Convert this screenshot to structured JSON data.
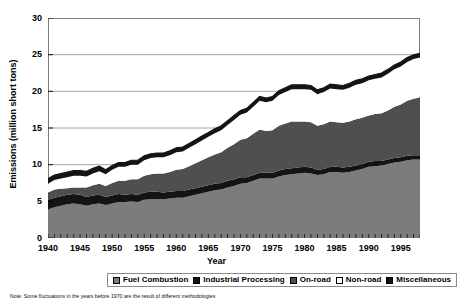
{
  "chart_data": {
    "type": "area",
    "stacked": true,
    "title": "",
    "xlabel": "Year",
    "ylabel": "Emissions (million short tons)",
    "xlim": [
      1940,
      1998
    ],
    "ylim": [
      0,
      30
    ],
    "ytick_step": 5,
    "yticks": [
      "0",
      "5",
      "10",
      "15",
      "20",
      "25",
      "30"
    ],
    "xticks": [
      "1940",
      "1945",
      "1950",
      "1955",
      "1960",
      "1965",
      "1970",
      "1975",
      "1980",
      "1985",
      "1990",
      "1995"
    ],
    "xtick_values": [
      1940,
      1945,
      1950,
      1955,
      1960,
      1965,
      1970,
      1975,
      1980,
      1985,
      1990,
      1995
    ],
    "minor_xticks": "annual",
    "grid": "horizontal",
    "legend_position": "bottom",
    "x": [
      1940,
      1941,
      1942,
      1943,
      1944,
      1945,
      1946,
      1947,
      1948,
      1949,
      1950,
      1951,
      1952,
      1953,
      1954,
      1955,
      1956,
      1957,
      1958,
      1959,
      1960,
      1961,
      1962,
      1963,
      1964,
      1965,
      1966,
      1967,
      1968,
      1969,
      1970,
      1971,
      1972,
      1973,
      1974,
      1975,
      1976,
      1977,
      1978,
      1979,
      1980,
      1981,
      1982,
      1983,
      1984,
      1985,
      1986,
      1987,
      1988,
      1989,
      1990,
      1991,
      1992,
      1993,
      1994,
      1995,
      1996,
      1997,
      1998
    ],
    "series": [
      {
        "name": "Fuel Combustion",
        "color": "#7c7c7c",
        "values": [
          3.9,
          4.2,
          4.4,
          4.6,
          4.7,
          4.6,
          4.4,
          4.6,
          4.7,
          4.5,
          4.7,
          4.9,
          4.9,
          5.0,
          4.9,
          5.2,
          5.3,
          5.3,
          5.3,
          5.4,
          5.5,
          5.5,
          5.7,
          5.9,
          6.1,
          6.3,
          6.5,
          6.6,
          6.9,
          7.1,
          7.4,
          7.5,
          7.8,
          8.1,
          8.1,
          8.1,
          8.4,
          8.6,
          8.7,
          8.8,
          8.9,
          8.8,
          8.6,
          8.7,
          9.0,
          9.0,
          8.9,
          9.0,
          9.2,
          9.4,
          9.7,
          9.8,
          9.9,
          10.1,
          10.3,
          10.4,
          10.6,
          10.7,
          10.7
        ]
      },
      {
        "name": "Industrial Processing",
        "color": "#141414",
        "values": [
          1.3,
          1.3,
          1.3,
          1.3,
          1.3,
          1.3,
          1.2,
          1.2,
          1.2,
          1.1,
          1.1,
          1.1,
          1.0,
          1.0,
          1.0,
          1.0,
          1.0,
          1.0,
          0.9,
          0.9,
          0.9,
          0.9,
          0.9,
          0.9,
          0.9,
          0.9,
          0.9,
          0.9,
          0.9,
          0.9,
          0.9,
          0.8,
          0.8,
          0.8,
          0.8,
          0.8,
          0.8,
          0.8,
          0.8,
          0.8,
          0.8,
          0.8,
          0.7,
          0.7,
          0.7,
          0.7,
          0.7,
          0.7,
          0.7,
          0.7,
          0.7,
          0.7,
          0.6,
          0.6,
          0.6,
          0.6,
          0.6,
          0.6,
          0.6
        ]
      },
      {
        "name": "On-road",
        "color": "#4f4f4f",
        "values": [
          1.0,
          1.1,
          1.0,
          0.9,
          0.9,
          1.0,
          1.3,
          1.4,
          1.5,
          1.5,
          1.7,
          1.8,
          1.9,
          2.0,
          2.1,
          2.3,
          2.4,
          2.5,
          2.6,
          2.7,
          2.9,
          3.0,
          3.2,
          3.4,
          3.6,
          3.8,
          4.0,
          4.2,
          4.5,
          4.8,
          5.1,
          5.3,
          5.6,
          5.9,
          5.7,
          5.8,
          6.1,
          6.2,
          6.4,
          6.3,
          6.2,
          6.2,
          6.0,
          6.1,
          6.2,
          6.1,
          6.1,
          6.2,
          6.3,
          6.3,
          6.3,
          6.4,
          6.5,
          6.7,
          7.0,
          7.2,
          7.5,
          7.7,
          7.9
        ]
      },
      {
        "name": "Non-road",
        "color": "#ffffff",
        "values": [
          1.2,
          1.3,
          1.4,
          1.5,
          1.6,
          1.6,
          1.5,
          1.6,
          1.7,
          1.6,
          1.8,
          1.9,
          1.9,
          2.0,
          2.0,
          2.1,
          2.2,
          2.2,
          2.2,
          2.3,
          2.4,
          2.4,
          2.5,
          2.6,
          2.7,
          2.8,
          2.9,
          3.0,
          3.1,
          3.3,
          3.4,
          3.5,
          3.7,
          3.9,
          3.9,
          4.0,
          4.2,
          4.3,
          4.4,
          4.4,
          4.4,
          4.4,
          4.3,
          4.4,
          4.5,
          4.5,
          4.5,
          4.6,
          4.7,
          4.7,
          4.8,
          4.8,
          4.9,
          5.0,
          5.1,
          5.2,
          5.3,
          5.4,
          5.4
        ]
      },
      {
        "name": "Miscellaneous",
        "color": "#141414",
        "values": [
          0.7,
          0.7,
          0.7,
          0.7,
          0.7,
          0.7,
          0.7,
          0.7,
          0.7,
          0.6,
          0.6,
          0.6,
          0.6,
          0.6,
          0.6,
          0.6,
          0.6,
          0.6,
          0.6,
          0.6,
          0.6,
          0.6,
          0.6,
          0.6,
          0.6,
          0.6,
          0.6,
          0.6,
          0.6,
          0.6,
          0.6,
          0.6,
          0.6,
          0.6,
          0.6,
          0.6,
          0.6,
          0.6,
          0.6,
          0.6,
          0.6,
          0.6,
          0.6,
          0.6,
          0.6,
          0.6,
          0.6,
          0.6,
          0.6,
          0.6,
          0.6,
          0.6,
          0.6,
          0.6,
          0.6,
          0.6,
          0.6,
          0.6,
          0.6
        ]
      }
    ],
    "totals": [
      8.1,
      8.6,
      8.8,
      9.0,
      9.2,
      9.2,
      9.1,
      9.5,
      9.8,
      9.3,
      9.9,
      10.3,
      10.3,
      10.6,
      10.6,
      11.2,
      11.5,
      11.6,
      11.6,
      11.9,
      12.3,
      12.4,
      12.9,
      13.4,
      13.9,
      14.4,
      14.9,
      15.3,
      16.0,
      16.7,
      17.4,
      17.7,
      18.5,
      19.3,
      19.1,
      19.3,
      20.1,
      20.5,
      20.9,
      20.9,
      20.9,
      20.8,
      20.2,
      20.5,
      21.0,
      20.9,
      20.8,
      21.1,
      21.5,
      21.7,
      22.1,
      22.3,
      22.5,
      23.0,
      23.6,
      24.0,
      24.6,
      25.0,
      25.2
    ]
  },
  "axis": {
    "y_title": "Emissions (million short tons)",
    "x_title": "Year"
  },
  "legend": {
    "items": [
      {
        "label": "Fuel Combustion",
        "color": "#7c7c7c"
      },
      {
        "label": "Industrial Processing",
        "color": "#141414"
      },
      {
        "label": "On-road",
        "color": "#4f4f4f"
      },
      {
        "label": "Non-road",
        "color": "#ffffff"
      },
      {
        "label": "Miscellaneous",
        "color": "#141414"
      }
    ]
  },
  "note": "Note:  Some fluctuations in the years before 1970 are the result of different methodologies"
}
